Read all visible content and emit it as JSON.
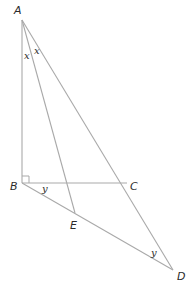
{
  "diagram": {
    "type": "geometry-figure",
    "points": {
      "A": {
        "label": "A",
        "x": 22,
        "y": 20
      },
      "B": {
        "label": "B",
        "x": 22,
        "y": 183
      },
      "C": {
        "label": "C",
        "x": 127,
        "y": 183
      },
      "E": {
        "label": "E",
        "x": 75,
        "y": 213
      },
      "D": {
        "label": "D",
        "x": 173,
        "y": 270
      }
    },
    "segments": [
      [
        "A",
        "B"
      ],
      [
        "A",
        "E"
      ],
      [
        "A",
        "D"
      ],
      [
        "B",
        "C"
      ],
      [
        "B",
        "D"
      ]
    ],
    "right_angle_at": "B",
    "angle_labels": {
      "x1": "x",
      "x2": "x",
      "y1": "y",
      "y2": "y"
    },
    "colors": {
      "line": "#a9a9a9",
      "text": "#2b2b2b",
      "background": "#ffffff"
    }
  }
}
